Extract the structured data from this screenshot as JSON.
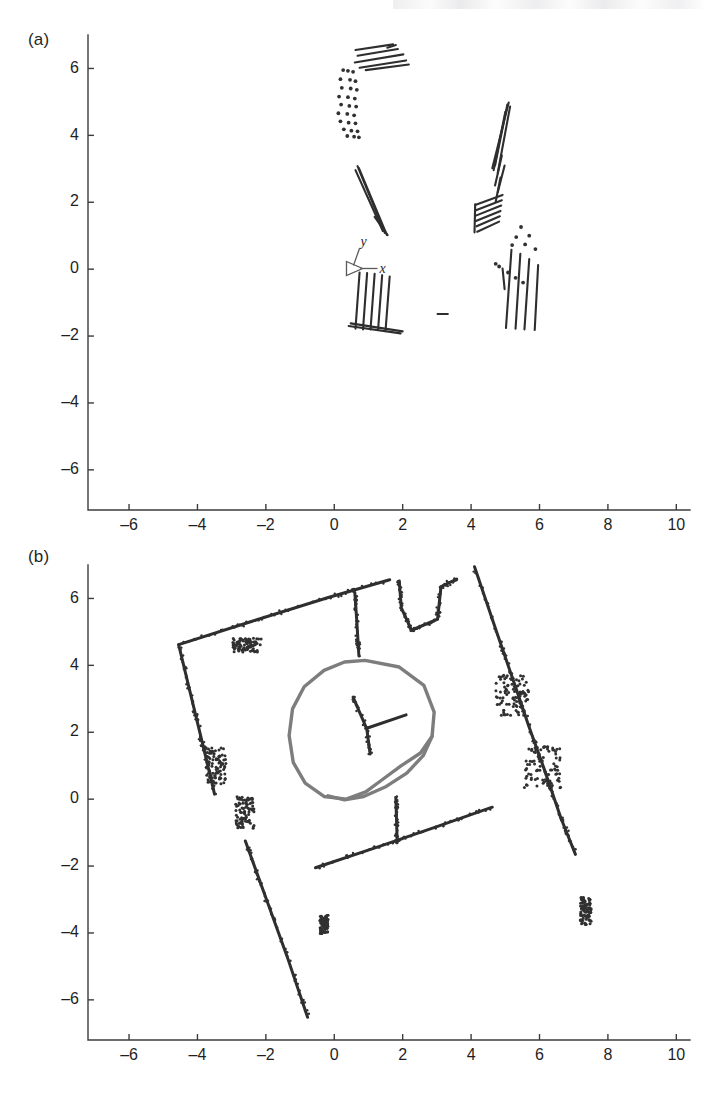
{
  "figure": {
    "background_color": "#ffffff",
    "ink_color": "#2e2e2e",
    "trajectory_color": "#7d7d7d",
    "axis_color": "#3c3c3c"
  },
  "panels": [
    {
      "id": "a",
      "label": "(a)",
      "frame_marker": {
        "x_label": "x",
        "y_label": "y"
      }
    },
    {
      "id": "b",
      "label": "(b)"
    }
  ],
  "chart_data": [
    {
      "type": "scatter",
      "title": "",
      "panel": "(a)",
      "xlabel": "",
      "ylabel": "",
      "xlim": [
        -7.2,
        10.4
      ],
      "ylim": [
        -7.2,
        7.0
      ],
      "grid": false,
      "legend": "none",
      "xticks": [
        -6,
        -4,
        -2,
        0,
        2,
        4,
        6,
        8,
        10
      ],
      "xticklabels": [
        "-6",
        "-4",
        "-2",
        "0",
        "2",
        "4",
        "6",
        "8",
        "10"
      ],
      "yticks": [
        6,
        4,
        2,
        0,
        -2,
        -4,
        -6
      ],
      "yticklabels": [
        "6",
        "4",
        "2",
        "0",
        "-2",
        "-4",
        "-6"
      ],
      "annotations": [
        {
          "text": "y",
          "x": 0.75,
          "y": 0.72,
          "style": "italic"
        },
        {
          "text": "x",
          "x": 1.35,
          "y": 0.05,
          "style": "italic"
        }
      ],
      "description": "Sparse raw laser scan features: short line segments and point clusters grouped in five regions",
      "segment_groups": [
        {
          "name": "top-horizontal-bundle",
          "comment": "near x 0.6-2.2, y 5.9-6.7, shallow slanted strokes",
          "segments": [
            [
              0.62,
              6.55,
              1.72,
              6.72
            ],
            [
              0.68,
              6.38,
              1.86,
              6.58
            ],
            [
              0.6,
              6.18,
              2.02,
              6.42
            ],
            [
              0.74,
              6.02,
              2.1,
              6.24
            ],
            [
              0.92,
              5.95,
              2.18,
              6.12
            ],
            [
              1.55,
              6.62,
              1.8,
              6.7
            ]
          ]
        },
        {
          "name": "left-vertical-dotted-column",
          "comment": "near x 0.1-0.8, y 4.0-6.0 dotted",
          "points": [
            [
              0.26,
              5.95
            ],
            [
              0.4,
              5.93
            ],
            [
              0.55,
              5.9
            ],
            [
              0.18,
              5.68
            ],
            [
              0.46,
              5.66
            ],
            [
              0.62,
              5.62
            ],
            [
              0.22,
              5.42
            ],
            [
              0.48,
              5.4
            ],
            [
              0.66,
              5.36
            ],
            [
              0.14,
              5.16
            ],
            [
              0.4,
              5.14
            ],
            [
              0.6,
              5.1
            ],
            [
              0.2,
              4.92
            ],
            [
              0.44,
              4.88
            ],
            [
              0.64,
              4.86
            ],
            [
              0.12,
              4.66
            ],
            [
              0.38,
              4.64
            ],
            [
              0.58,
              4.6
            ],
            [
              0.18,
              4.42
            ],
            [
              0.42,
              4.38
            ],
            [
              0.62,
              4.36
            ],
            [
              0.28,
              4.18
            ],
            [
              0.5,
              4.14
            ],
            [
              0.68,
              4.12
            ],
            [
              0.38,
              3.98
            ],
            [
              0.58,
              3.96
            ],
            [
              0.72,
              3.94
            ]
          ]
        },
        {
          "name": "center-slanted-pair",
          "comment": "near x 0.6-1.6, y 1.0-3.1",
          "segments": [
            [
              0.68,
              3.08,
              1.48,
              1.08
            ],
            [
              0.72,
              3.02,
              1.54,
              1.02
            ],
            [
              0.62,
              2.96,
              1.42,
              1.14
            ],
            [
              1.18,
              1.56,
              1.56,
              1.02
            ]
          ]
        },
        {
          "name": "lower-left-fan",
          "comment": "near x 0.6-2.0, y -1.9 to -0.1, fan of near-vertical strokes meeting a baseline",
          "segments": [
            [
              0.74,
              -0.1,
              0.62,
              -1.78
            ],
            [
              0.96,
              -0.12,
              0.84,
              -1.8
            ],
            [
              1.18,
              -0.14,
              1.06,
              -1.8
            ],
            [
              1.4,
              -0.18,
              1.28,
              -1.82
            ],
            [
              1.62,
              -0.22,
              1.5,
              -1.82
            ],
            [
              0.48,
              -1.62,
              2.0,
              -1.86
            ],
            [
              0.42,
              -1.7,
              1.94,
              -1.92
            ]
          ]
        },
        {
          "name": "right-long-slant",
          "comment": "near x 4.6-5.6, y 1.0-5.0, long thin slanted strokes",
          "segments": [
            [
              5.1,
              4.98,
              4.62,
              3.02
            ],
            [
              5.06,
              4.92,
              4.7,
              3.1
            ],
            [
              5.14,
              4.86,
              4.78,
              2.88
            ],
            [
              5.0,
              4.7,
              4.66,
              2.96
            ],
            [
              4.9,
              3.4,
              4.7,
              2.5
            ],
            [
              4.98,
              3.1,
              4.78,
              2.3
            ],
            [
              4.86,
              2.74,
              4.72,
              2.02
            ]
          ]
        },
        {
          "name": "right-comb",
          "comment": "near x 4.1-5.0, y 1.1-2.3, comb-like strokes",
          "segments": [
            [
              4.12,
              1.92,
              4.92,
              2.22
            ],
            [
              4.14,
              1.76,
              4.9,
              2.06
            ],
            [
              4.14,
              1.6,
              4.88,
              1.9
            ],
            [
              4.14,
              1.44,
              4.86,
              1.74
            ],
            [
              4.16,
              1.28,
              4.84,
              1.58
            ],
            [
              4.18,
              1.12,
              4.82,
              1.42
            ],
            [
              4.1,
              1.1,
              4.12,
              1.94
            ]
          ]
        },
        {
          "name": "right-lower-fan",
          "comment": "near x 4.9-6.2, y -1.9 to 0.6",
          "segments": [
            [
              5.18,
              0.58,
              5.02,
              -1.76
            ],
            [
              5.44,
              0.46,
              5.3,
              -1.78
            ],
            [
              5.7,
              0.3,
              5.56,
              -1.8
            ],
            [
              5.96,
              0.12,
              5.86,
              -1.82
            ],
            [
              4.92,
              0.02,
              4.98,
              -0.6
            ]
          ],
          "points": [
            [
              5.46,
              1.26
            ],
            [
              5.32,
              0.96
            ],
            [
              5.2,
              0.72
            ],
            [
              5.7,
              1.0
            ],
            [
              5.58,
              0.74
            ],
            [
              5.88,
              0.6
            ],
            [
              4.72,
              0.16
            ],
            [
              4.82,
              0.08
            ],
            [
              5.08,
              -0.1
            ],
            [
              5.3,
              -0.26
            ],
            [
              5.52,
              -0.4
            ]
          ]
        },
        {
          "name": "isolated-dash",
          "comment": "near x 3.1, y -1.35",
          "segments": [
            [
              3.02,
              -1.34,
              3.32,
              -1.34
            ]
          ]
        }
      ]
    },
    {
      "type": "scatter",
      "title": "",
      "panel": "(b)",
      "xlabel": "",
      "ylabel": "",
      "xlim": [
        -7.2,
        10.4
      ],
      "ylim": [
        -7.2,
        7.0
      ],
      "grid": false,
      "legend": "none",
      "xticks": [
        -6,
        -4,
        -2,
        0,
        2,
        4,
        6,
        8,
        10
      ],
      "xticklabels": [
        "-6",
        "-4",
        "-2",
        "0",
        "2",
        "4",
        "6",
        "8",
        "10"
      ],
      "yticks": [
        6,
        4,
        2,
        0,
        -2,
        -4,
        -6
      ],
      "yticklabels": [
        "6",
        "4",
        "2",
        "0",
        "-2",
        "-4",
        "-6"
      ],
      "description": "Accumulated occupancy map of a rotated rectangular room with interior partitions and a closed gray robot trajectory loop near the center",
      "walls": [
        {
          "name": "north-west-wall",
          "comment": "upper-left slanted wall from (-4.55,4.65) up to (1.60,6.55)",
          "polyline": [
            [
              -4.55,
              4.62
            ],
            [
              -2.4,
              5.32
            ],
            [
              -0.2,
              6.02
            ],
            [
              1.62,
              6.56
            ]
          ]
        },
        {
          "name": "west-wall",
          "comment": "left wall running down from (-4.55,4.62) to (-3.45,0.05)",
          "polyline": [
            [
              -4.55,
              4.62
            ],
            [
              -4.22,
              3.22
            ],
            [
              -3.86,
              1.7
            ],
            [
              -3.5,
              0.15
            ]
          ]
        },
        {
          "name": "south-west-wall",
          "comment": "long lower-left wall from (-2.60,-1.25) to (-0.75,-6.55)",
          "polyline": [
            [
              -2.6,
              -1.25
            ],
            [
              -2.0,
              -2.95
            ],
            [
              -1.38,
              -4.7
            ],
            [
              -0.78,
              -6.52
            ]
          ]
        },
        {
          "name": "south-wall",
          "comment": "lower wall from (-0.55,-2.05) to (4.65,-0.22)",
          "polyline": [
            [
              -0.55,
              -2.05
            ],
            [
              1.3,
              -1.42
            ],
            [
              3.0,
              -0.82
            ],
            [
              4.62,
              -0.24
            ]
          ]
        },
        {
          "name": "east-wall",
          "comment": "long right wall from (4.12,6.95) down to (7.25,-2.15)",
          "polyline": [
            [
              4.1,
              6.95
            ],
            [
              4.78,
              4.9
            ],
            [
              5.3,
              3.35
            ],
            [
              5.68,
              2.2
            ],
            [
              6.12,
              0.95
            ],
            [
              6.62,
              -0.55
            ],
            [
              7.05,
              -1.65
            ]
          ]
        },
        {
          "name": "interior-partition-north",
          "comment": "vertical partition descending from the north wall near x=0.6",
          "polyline": [
            [
              0.6,
              6.18
            ],
            [
              0.66,
              5.3
            ],
            [
              0.72,
              4.28
            ]
          ]
        },
        {
          "name": "interior-partition-south",
          "comment": "vertical partition rising from south wall near x=1.85",
          "polyline": [
            [
              1.84,
              -1.3
            ],
            [
              1.82,
              -0.6
            ],
            [
              1.8,
              0.05
            ]
          ]
        },
        {
          "name": "north-alcove",
          "comment": "small step/alcove structure top-center right around x 1.8-3.6, y 5.0-6.6",
          "polyline": [
            [
              1.9,
              6.52
            ],
            [
              1.96,
              5.72
            ],
            [
              2.26,
              5.05
            ],
            [
              3.02,
              5.38
            ],
            [
              3.12,
              6.35
            ],
            [
              3.58,
              6.58
            ]
          ]
        },
        {
          "name": "center-cross-feature",
          "comment": "T-shaped dark feature inside the loop near (0.9,2.2)",
          "polyline": [
            [
              0.55,
              3.05
            ],
            [
              0.95,
              2.1
            ],
            [
              1.05,
              1.35
            ]
          ],
          "branch": [
            [
              0.95,
              2.12
            ],
            [
              2.1,
              2.52
            ]
          ]
        }
      ],
      "clutter_clusters": [
        {
          "name": "cluster-nw-interior",
          "center": [
            -2.55,
            4.6
          ],
          "spread": [
            0.42,
            0.22
          ]
        },
        {
          "name": "cluster-w-lower",
          "center": [
            -3.45,
            1.0
          ],
          "spread": [
            0.3,
            0.55
          ]
        },
        {
          "name": "cluster-w-bottom",
          "center": [
            -2.62,
            -0.4
          ],
          "spread": [
            0.28,
            0.48
          ]
        },
        {
          "name": "cluster-e-upper",
          "center": [
            5.2,
            3.1
          ],
          "spread": [
            0.48,
            0.62
          ]
        },
        {
          "name": "cluster-e-lower",
          "center": [
            6.1,
            0.95
          ],
          "spread": [
            0.55,
            0.7
          ]
        },
        {
          "name": "cluster-e-far",
          "center": [
            7.35,
            -3.35
          ],
          "spread": [
            0.16,
            0.42
          ]
        },
        {
          "name": "cluster-s-small",
          "center": [
            -0.3,
            -3.75
          ],
          "spread": [
            0.12,
            0.28
          ]
        }
      ],
      "trajectory": {
        "name": "robot-path-loop",
        "color": "#7d7d7d",
        "closed": true,
        "comment": "Large counter-clockwise closed loop with a small inner crossing lobe at lower right",
        "polyline": [
          [
            0.9,
            4.15
          ],
          [
            1.9,
            3.95
          ],
          [
            2.62,
            3.4
          ],
          [
            2.92,
            2.6
          ],
          [
            2.86,
            1.88
          ],
          [
            2.52,
            1.38
          ],
          [
            1.96,
            1.0
          ],
          [
            1.4,
            0.58
          ],
          [
            0.92,
            0.22
          ],
          [
            0.35,
            0.0
          ],
          [
            -0.3,
            0.08
          ],
          [
            -0.85,
            0.48
          ],
          [
            -1.2,
            1.1
          ],
          [
            -1.32,
            1.9
          ],
          [
            -1.22,
            2.7
          ],
          [
            -0.88,
            3.36
          ],
          [
            -0.3,
            3.85
          ],
          [
            0.3,
            4.1
          ],
          [
            0.9,
            4.15
          ]
        ],
        "inner_lobe": [
          [
            2.86,
            1.88
          ],
          [
            2.6,
            1.3
          ],
          [
            2.12,
            0.78
          ],
          [
            1.52,
            0.38
          ],
          [
            0.86,
            0.08
          ],
          [
            0.3,
            -0.02
          ],
          [
            -0.18,
            0.1
          ]
        ]
      }
    }
  ]
}
